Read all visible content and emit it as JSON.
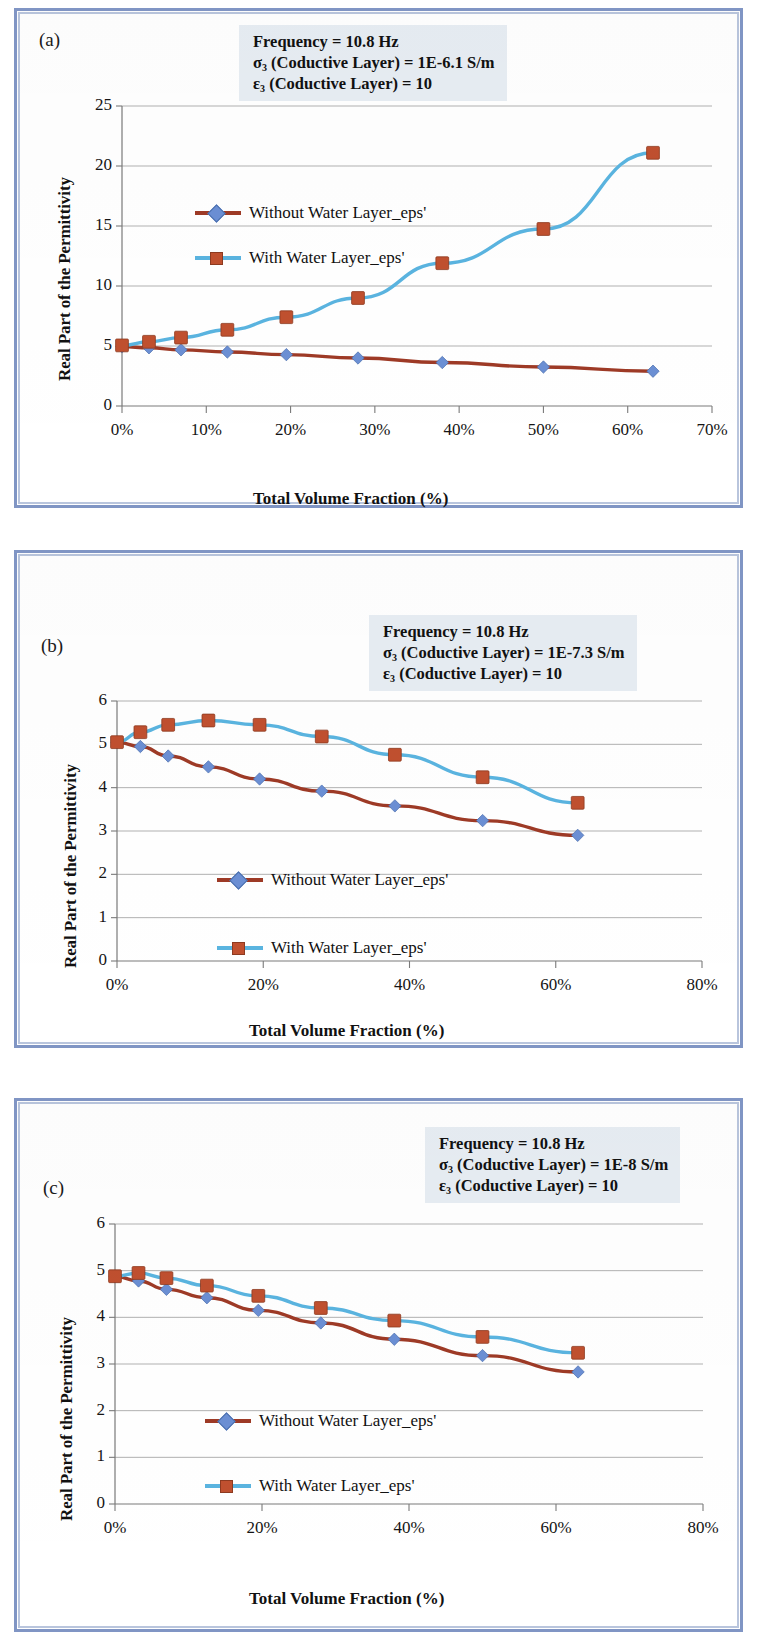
{
  "figure": {
    "panels": [
      {
        "letter": "(a)",
        "annotation": {
          "line1": "Frequency = 10.8 Hz",
          "line2_pre": "σ",
          "line2_sub": "3",
          "line2_post": " (Coductive Layer) = 1E-6.1 S/m",
          "line3_pre": "ε",
          "line3_sub": "3",
          "line3_post": " (Coductive Layer) = 10"
        },
        "chart_data": {
          "type": "line",
          "title": "",
          "xlabel": "Total Volume Fraction (%)",
          "ylabel": "Real Part of the Permittivity",
          "xlim": [
            0,
            70
          ],
          "ylim": [
            0,
            25
          ],
          "xticks": [
            "0%",
            "10%",
            "20%",
            "30%",
            "40%",
            "50%",
            "60%",
            "70%"
          ],
          "xtick_values": [
            0,
            10,
            20,
            30,
            40,
            50,
            60,
            70
          ],
          "yticks": [
            "0",
            "5",
            "10",
            "15",
            "20",
            "25"
          ],
          "ytick_values": [
            0,
            5,
            10,
            15,
            20,
            25
          ],
          "grid": true,
          "legend_position": "inside-upper-left",
          "x": [
            0,
            3.2,
            7.0,
            12.5,
            19.5,
            28.0,
            38.0,
            50.0,
            63.0
          ],
          "series": [
            {
              "name": "Without Water Layer_eps'",
              "marker": "diamond",
              "line_color": "#9e3a26",
              "marker_color": "#6b8fd4",
              "values": [
                4.95,
                4.85,
                4.68,
                4.5,
                4.28,
                4.0,
                3.62,
                3.25,
                2.9
              ]
            },
            {
              "name": "With Water Layer_eps'",
              "marker": "square",
              "line_color": "#5ab4e0",
              "marker_color": "#c0502f",
              "values": [
                5.05,
                5.35,
                5.7,
                6.35,
                7.4,
                9.0,
                11.9,
                14.75,
                21.1
              ]
            }
          ]
        }
      },
      {
        "letter": "(b)",
        "annotation": {
          "line1": "Frequency = 10.8 Hz",
          "line2_pre": "σ",
          "line2_sub": "3",
          "line2_post": " (Coductive Layer) = 1E-7.3 S/m",
          "line3_pre": "ε",
          "line3_sub": "3",
          "line3_post": " (Coductive Layer) = 10"
        },
        "chart_data": {
          "type": "line",
          "title": "",
          "xlabel": "Total Volume Fraction (%)",
          "ylabel": "Real Part of the Permittivity",
          "xlim": [
            0,
            80
          ],
          "ylim": [
            0,
            6
          ],
          "xticks": [
            "0%",
            "20%",
            "40%",
            "60%",
            "80%"
          ],
          "xtick_values": [
            0,
            20,
            40,
            60,
            80
          ],
          "yticks": [
            "0",
            "1",
            "2",
            "3",
            "4",
            "5",
            "6"
          ],
          "ytick_values": [
            0,
            1,
            2,
            3,
            4,
            5,
            6
          ],
          "grid": true,
          "legend_position": "inside-lower-center",
          "x": [
            0,
            3.2,
            7.0,
            12.5,
            19.5,
            28.0,
            38.0,
            50.0,
            63.0
          ],
          "series": [
            {
              "name": "Without Water Layer_eps'",
              "marker": "diamond",
              "line_color": "#9e3a26",
              "marker_color": "#6b8fd4",
              "values": [
                5.05,
                4.95,
                4.73,
                4.48,
                4.2,
                3.92,
                3.58,
                3.24,
                2.9
              ]
            },
            {
              "name": "With Water Layer_eps'",
              "marker": "square",
              "line_color": "#5ab4e0",
              "marker_color": "#c0502f",
              "values": [
                5.05,
                5.28,
                5.45,
                5.55,
                5.45,
                5.18,
                4.76,
                4.24,
                3.65
              ]
            }
          ]
        }
      },
      {
        "letter": "(c)",
        "annotation": {
          "line1": "Frequency = 10.8 Hz",
          "line2_pre": "σ",
          "line2_sub": "3",
          "line2_post": " (Coductive Layer) = 1E-8 S/m",
          "line3_pre": "ε",
          "line3_sub": "3",
          "line3_post": " (Coductive Layer) = 10"
        },
        "chart_data": {
          "type": "line",
          "title": "",
          "xlabel": "Total Volume Fraction (%)",
          "ylabel": "Real Part of the Permittivity",
          "xlim": [
            0,
            80
          ],
          "ylim": [
            0,
            6
          ],
          "xticks": [
            "0%",
            "20%",
            "40%",
            "60%",
            "80%"
          ],
          "xtick_values": [
            0,
            20,
            40,
            60,
            80
          ],
          "yticks": [
            "0",
            "1",
            "2",
            "3",
            "4",
            "5",
            "6"
          ],
          "ytick_values": [
            0,
            1,
            2,
            3,
            4,
            5,
            6
          ],
          "grid": true,
          "legend_position": "inside-lower-center",
          "x": [
            0,
            3.2,
            7.0,
            12.5,
            19.5,
            28.0,
            38.0,
            50.0,
            63.0
          ],
          "series": [
            {
              "name": "Without Water Layer_eps'",
              "marker": "diamond",
              "line_color": "#9e3a26",
              "marker_color": "#6b8fd4",
              "values": [
                4.88,
                4.78,
                4.6,
                4.42,
                4.15,
                3.88,
                3.53,
                3.18,
                2.83
              ]
            },
            {
              "name": "With Water Layer_eps'",
              "marker": "square",
              "line_color": "#5ab4e0",
              "marker_color": "#c0502f",
              "values": [
                4.88,
                4.95,
                4.84,
                4.68,
                4.46,
                4.2,
                3.93,
                3.58,
                3.24
              ]
            }
          ]
        }
      }
    ]
  }
}
